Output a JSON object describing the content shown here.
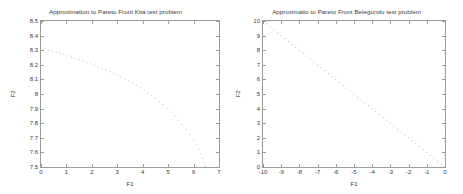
{
  "figure": {
    "background": "#ffffff",
    "frame_color": "#9b9b9b",
    "point_color": "#c8c8c8",
    "text_color": "#3a3a3a"
  },
  "chart_data": [
    {
      "type": "scatter",
      "title": "Approximation to Pareto Front Kita test problem",
      "xlabel": "F1",
      "ylabel": "F2",
      "xlim": [
        0,
        7
      ],
      "ylim": [
        7.5,
        8.5
      ],
      "xticks": [
        "0",
        "1",
        "2",
        "3",
        "4",
        "5",
        "6",
        "7"
      ],
      "xtick_values": [
        0,
        1,
        2,
        3,
        4,
        5,
        6,
        7
      ],
      "yticks": [
        "7.5",
        "7.6",
        "7.7",
        "7.8",
        "7.9",
        "8",
        "8.1",
        "8.2",
        "8.3",
        "8.4",
        "8.5"
      ],
      "ytick_values": [
        7.5,
        7.6,
        7.7,
        7.8,
        7.9,
        8.0,
        8.1,
        8.2,
        8.3,
        8.4,
        8.5
      ],
      "grid": false,
      "legend": "none",
      "marker": "dot",
      "points": [
        [
          0.15,
          8.31
        ],
        [
          0.3,
          8.3
        ],
        [
          0.45,
          8.293
        ],
        [
          0.6,
          8.286
        ],
        [
          0.75,
          8.278
        ],
        [
          0.9,
          8.27
        ],
        [
          1.05,
          8.262
        ],
        [
          1.2,
          8.254
        ],
        [
          1.35,
          8.245
        ],
        [
          1.5,
          8.236
        ],
        [
          1.65,
          8.227
        ],
        [
          1.8,
          8.217
        ],
        [
          1.95,
          8.207
        ],
        [
          2.1,
          8.197
        ],
        [
          2.25,
          8.187
        ],
        [
          2.4,
          8.176
        ],
        [
          2.55,
          8.165
        ],
        [
          2.7,
          8.153
        ],
        [
          2.85,
          8.141
        ],
        [
          3.0,
          8.129
        ],
        [
          3.15,
          8.116
        ],
        [
          3.3,
          8.103
        ],
        [
          3.45,
          8.089
        ],
        [
          3.6,
          8.074
        ],
        [
          3.75,
          8.059
        ],
        [
          3.9,
          8.043
        ],
        [
          4.05,
          8.026
        ],
        [
          4.2,
          8.008
        ],
        [
          4.35,
          7.989
        ],
        [
          4.5,
          7.969
        ],
        [
          4.65,
          7.948
        ],
        [
          4.8,
          7.926
        ],
        [
          4.95,
          7.902
        ],
        [
          5.1,
          7.877
        ],
        [
          5.25,
          7.85
        ],
        [
          5.4,
          7.821
        ],
        [
          5.55,
          7.79
        ],
        [
          5.7,
          7.757
        ],
        [
          5.85,
          7.721
        ],
        [
          6.0,
          7.682
        ],
        [
          6.1,
          7.653
        ],
        [
          6.2,
          7.621
        ],
        [
          6.28,
          7.592
        ],
        [
          6.35,
          7.562
        ],
        [
          6.4,
          7.535
        ],
        [
          6.44,
          7.513
        ],
        [
          6.46,
          7.502
        ]
      ]
    },
    {
      "type": "scatter",
      "title": "Approximatio to Pareto Front Belegundu test problem",
      "xlabel": "F1",
      "ylabel": "F2",
      "xlim": [
        -10,
        0
      ],
      "ylim": [
        0,
        10
      ],
      "xticks": [
        "-10",
        "-9",
        "-8",
        "-7",
        "-6",
        "-5",
        "-4",
        "-3",
        "-2",
        "-1",
        "0"
      ],
      "xtick_values": [
        -10,
        -9,
        -8,
        -7,
        -6,
        -5,
        -4,
        -3,
        -2,
        -1,
        0
      ],
      "yticks": [
        "0",
        "1",
        "2",
        "3",
        "4",
        "5",
        "6",
        "7",
        "8",
        "9",
        "10"
      ],
      "ytick_values": [
        0,
        1,
        2,
        3,
        4,
        5,
        6,
        7,
        8,
        9,
        10
      ],
      "grid": false,
      "legend": "none",
      "marker": "dot",
      "line_fit": {
        "slope": -1.0,
        "intercept": 0.0
      },
      "points": [
        [
          -9.8,
          9.8
        ],
        [
          -9.6,
          9.6
        ],
        [
          -9.4,
          9.4
        ],
        [
          -9.2,
          9.2
        ],
        [
          -9.0,
          9.0
        ],
        [
          -8.8,
          8.8
        ],
        [
          -8.6,
          8.6
        ],
        [
          -8.4,
          8.4
        ],
        [
          -8.2,
          8.2
        ],
        [
          -8.0,
          8.0
        ],
        [
          -7.8,
          7.8
        ],
        [
          -7.6,
          7.6
        ],
        [
          -7.4,
          7.4
        ],
        [
          -7.2,
          7.2
        ],
        [
          -7.0,
          7.0
        ],
        [
          -6.8,
          6.8
        ],
        [
          -6.6,
          6.6
        ],
        [
          -6.4,
          6.4
        ],
        [
          -6.2,
          6.2
        ],
        [
          -6.0,
          6.0
        ],
        [
          -5.8,
          5.8
        ],
        [
          -5.6,
          5.6
        ],
        [
          -5.4,
          5.4
        ],
        [
          -5.2,
          5.2
        ],
        [
          -5.0,
          5.0
        ],
        [
          -4.8,
          4.8
        ],
        [
          -4.6,
          4.6
        ],
        [
          -4.4,
          4.4
        ],
        [
          -4.2,
          4.2
        ],
        [
          -4.0,
          4.0
        ],
        [
          -3.8,
          3.8
        ],
        [
          -3.6,
          3.6
        ],
        [
          -3.4,
          3.4
        ],
        [
          -3.2,
          3.2
        ],
        [
          -3.0,
          3.0
        ],
        [
          -2.8,
          2.8
        ],
        [
          -2.6,
          2.6
        ],
        [
          -2.4,
          2.4
        ],
        [
          -2.2,
          2.2
        ],
        [
          -2.0,
          2.0
        ],
        [
          -1.8,
          1.8
        ],
        [
          -1.6,
          1.6
        ],
        [
          -1.4,
          1.4
        ],
        [
          -1.2,
          1.2
        ],
        [
          -1.0,
          1.0
        ],
        [
          -0.8,
          0.8
        ],
        [
          -0.6,
          0.6
        ],
        [
          -0.4,
          0.4
        ],
        [
          -0.2,
          0.2
        ],
        [
          -0.05,
          0.05
        ]
      ]
    }
  ]
}
